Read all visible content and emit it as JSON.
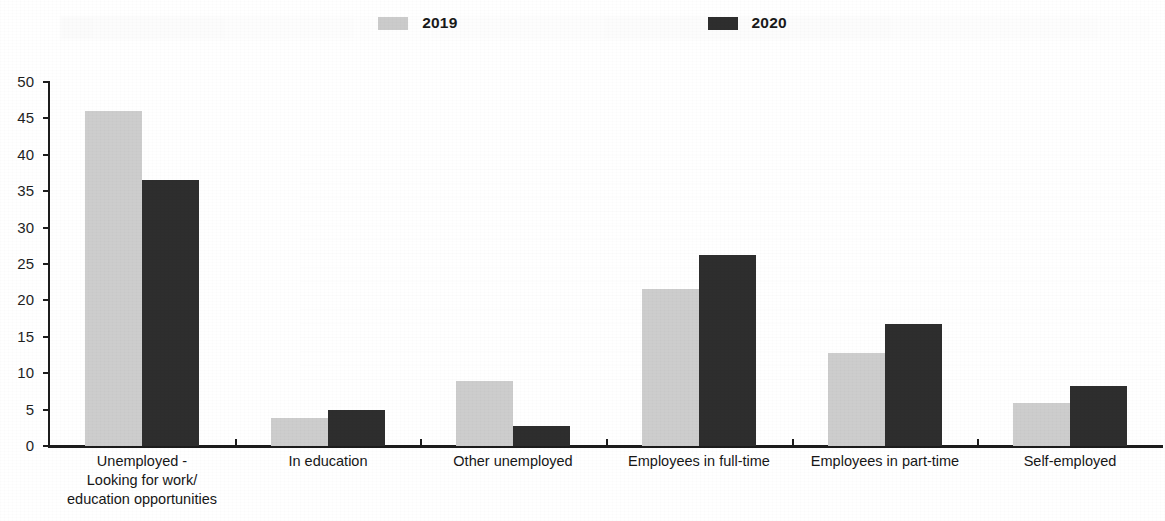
{
  "legend": {
    "entries": [
      {
        "label": "2019",
        "color": "#cbcbcb",
        "swatch_name": "legend-swatch-2019"
      },
      {
        "label": "2020",
        "color": "#2e2e2e",
        "swatch_name": "legend-swatch-2020"
      }
    ]
  },
  "axis": {
    "y_ticks": [
      "0",
      "5",
      "10",
      "15",
      "20",
      "25",
      "30",
      "35",
      "40",
      "45",
      "50"
    ],
    "y_min": 0,
    "y_max": 50,
    "y_step": 5
  },
  "chart_data": {
    "type": "bar",
    "title": "",
    "subtitle": "",
    "xlabel": "",
    "ylabel": "",
    "ylim": [
      0,
      50
    ],
    "ytick_step": 5,
    "grid": false,
    "legend_position": "top-center",
    "categories": [
      "Unemployed -\nLooking for work/\neducation opportunities",
      "In education",
      "Other unemployed",
      "Employees in full-time",
      "Employees in part-time",
      "Self-employed"
    ],
    "category_lines": [
      [
        "Unemployed -",
        "Looking for work/",
        "education opportunities"
      ],
      [
        "In education"
      ],
      [
        "Other unemployed"
      ],
      [
        "Employees in full-time"
      ],
      [
        "Employees in part-time"
      ],
      [
        "Self-employed"
      ]
    ],
    "series": [
      {
        "name": "2019",
        "color": "#cdcdcd",
        "values": [
          46.0,
          3.8,
          8.9,
          21.6,
          12.8,
          5.9
        ]
      },
      {
        "name": "2020",
        "color": "#2e2e2e",
        "values": [
          36.5,
          5.0,
          2.7,
          26.3,
          16.7,
          8.3
        ]
      }
    ]
  }
}
